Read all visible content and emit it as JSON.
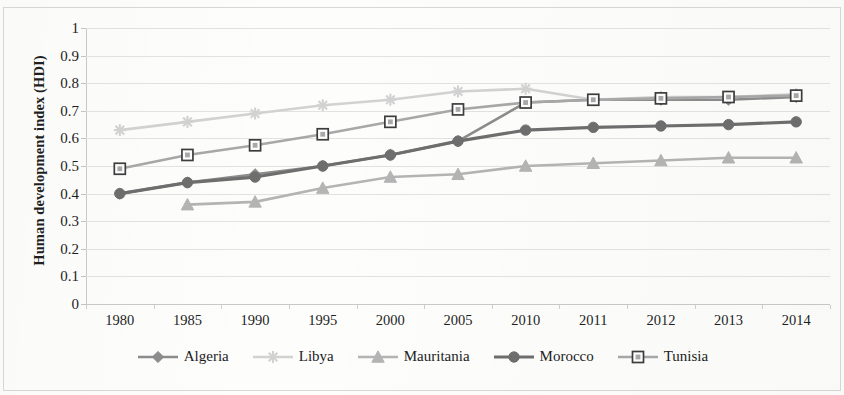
{
  "figure": {
    "background_color": "#fdfdfc",
    "border_color": "#d8d8d6"
  },
  "axes": {
    "ylabel": "Human development index (HDI)",
    "xlabel": "",
    "y_ticks": [
      "0",
      "0.1",
      "0.2",
      "0.3",
      "0.4",
      "0.5",
      "0.6",
      "0.7",
      "0.8",
      "0.9",
      "1"
    ],
    "x_ticks": [
      "1980",
      "1985",
      "1990",
      "1995",
      "2000",
      "2005",
      "2010",
      "2011",
      "2012",
      "2013",
      "2014"
    ]
  },
  "legend": {
    "position": "bottom",
    "items": [
      {
        "label": "Algeria",
        "color": "#8c8c8c",
        "marker": "diamond-icon"
      },
      {
        "label": "Libya",
        "color": "#d2d2d2",
        "marker": "star-icon"
      },
      {
        "label": "Mauritania",
        "color": "#b4b4b4",
        "marker": "triangle-icon"
      },
      {
        "label": "Morocco",
        "color": "#6e6e6e",
        "marker": "circle-icon"
      },
      {
        "label": "Tunisia",
        "color": "#a8a8a8",
        "marker": "open-square-icon"
      }
    ]
  },
  "chart_data": {
    "type": "line",
    "title": "",
    "xlabel": "",
    "ylabel": "Human development index (HDI)",
    "categories": [
      "1980",
      "1985",
      "1990",
      "1995",
      "2000",
      "2005",
      "2010",
      "2011",
      "2012",
      "2013",
      "2014"
    ],
    "ylim": [
      0,
      1
    ],
    "ytick_step": 0.1,
    "grid": true,
    "legend_position": "bottom",
    "series": [
      {
        "name": "Algeria",
        "color": "#8c8c8c",
        "marker": "diamond",
        "values": [
          0.4,
          0.44,
          0.47,
          0.5,
          0.54,
          0.59,
          0.73,
          0.74,
          0.74,
          0.74,
          0.75
        ]
      },
      {
        "name": "Libya",
        "color": "#d2d2d2",
        "marker": "star",
        "values": [
          0.63,
          0.66,
          0.69,
          0.72,
          0.74,
          0.77,
          0.78,
          0.74,
          0.75,
          0.75,
          0.76
        ]
      },
      {
        "name": "Mauritania",
        "color": "#b4b4b4",
        "marker": "triangle",
        "values": [
          null,
          0.36,
          0.37,
          0.42,
          0.46,
          0.47,
          0.5,
          0.51,
          0.52,
          0.53,
          0.53
        ]
      },
      {
        "name": "Morocco",
        "color": "#6e6e6e",
        "marker": "circle",
        "values": [
          0.4,
          0.44,
          0.46,
          0.5,
          0.54,
          0.59,
          0.63,
          0.64,
          0.645,
          0.65,
          0.66
        ]
      },
      {
        "name": "Tunisia",
        "color": "#a8a8a8",
        "marker": "open-square",
        "values": [
          0.49,
          0.54,
          0.575,
          0.615,
          0.66,
          0.705,
          0.73,
          0.74,
          0.745,
          0.75,
          0.755
        ]
      }
    ]
  }
}
